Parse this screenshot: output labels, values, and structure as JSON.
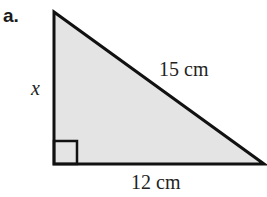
{
  "figure": {
    "part_label": "a.",
    "shape": "right-triangle",
    "fill_color": "#e4e4e4",
    "stroke_color": "#111111",
    "vertices": {
      "top": [
        54,
        12
      ],
      "right_angle": [
        54,
        164
      ],
      "right": [
        264,
        164
      ]
    },
    "right_angle_marker": {
      "size": 23
    },
    "labels": {
      "vertical_side": "x",
      "hypotenuse": "15 cm",
      "base": "12 cm"
    }
  }
}
